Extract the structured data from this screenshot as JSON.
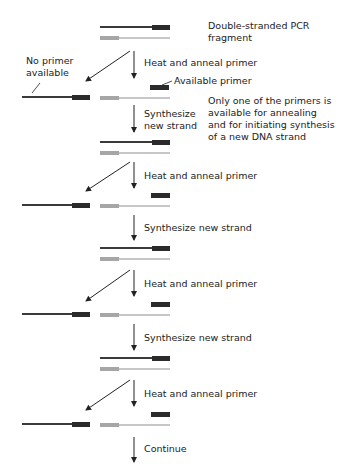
{
  "colors": {
    "dark_strand": "#3a3a3a",
    "dark_primer": "#2b2b2b",
    "light_strand": "#b5b5b5",
    "light_primer": "#a6a6a6",
    "arrow": "#222222"
  },
  "labels": {
    "start": "Double-stranded PCR",
    "start2": "fragment",
    "no_primer": "No primer",
    "no_primer2": "available",
    "available_primer": "Available primer",
    "note1": "Only one of the primers is",
    "note2": "available for annealing",
    "note3": "and for initiating synthesis",
    "note4": "of a new DNA strand",
    "steps": [
      {
        "label": "Heat and anneal primer"
      },
      {
        "label": "Synthesize",
        "label2": "new strand"
      },
      {
        "label": "Heat and anneal primer"
      },
      {
        "label": "Synthesize new strand"
      },
      {
        "label": "Heat and anneal primer"
      },
      {
        "label": "Synthesize new strand"
      },
      {
        "label": "Heat and anneal primer"
      },
      {
        "label": "Continue"
      }
    ]
  }
}
